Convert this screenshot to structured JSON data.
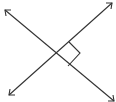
{
  "diagram": {
    "stroke_color": "#333333",
    "background": "#ffffff",
    "lines": [
      {
        "name": "line-a",
        "from": [
          5,
          10
        ],
        "to": [
          113,
          100
        ],
        "arrows": "both"
      },
      {
        "name": "line-b",
        "from": [
          9,
          95
        ],
        "to": [
          112,
          3
        ],
        "arrows": "both"
      }
    ],
    "intersection": [
      54,
      55
    ],
    "right_angle_marker": {
      "points": [
        [
          69,
          42
        ],
        [
          80,
          53
        ],
        [
          68,
          66
        ]
      ]
    }
  }
}
